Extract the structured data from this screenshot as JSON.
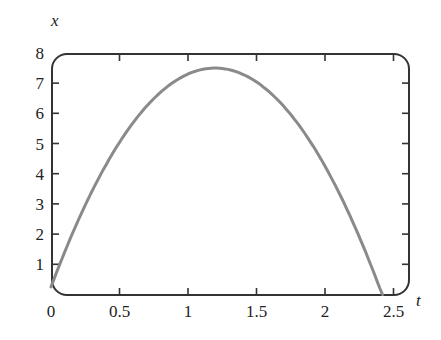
{
  "chart_data": {
    "type": "line",
    "title": "",
    "xlabel": "t",
    "ylabel": "x",
    "xlim": [
      0,
      2.6
    ],
    "ylim": [
      0,
      8
    ],
    "x_ticks": [
      0,
      0.5,
      1,
      1.5,
      2,
      2.5
    ],
    "x_tick_labels": [
      "0",
      "0.5",
      "1",
      "1.5",
      "2",
      "2.5"
    ],
    "y_ticks": [
      1,
      2,
      3,
      4,
      5,
      6,
      7,
      8
    ],
    "y_tick_labels": [
      "1",
      "2",
      "3",
      "4",
      "5",
      "6",
      "7",
      "8"
    ],
    "grid": false,
    "legend": null,
    "frame": "rounded box with ticks on all sides",
    "series": [
      {
        "name": "x(t)",
        "color": "#8a8a8a",
        "x": [
          0,
          0.2,
          0.4,
          0.6,
          0.8,
          1.0,
          1.2,
          1.4,
          1.6,
          1.8,
          2.0,
          2.2,
          2.4,
          2.42
        ],
        "y": [
          0.25,
          2.47,
          4.28,
          5.69,
          6.7,
          7.3,
          7.5,
          7.3,
          6.7,
          5.69,
          4.25,
          2.47,
          0.24,
          0.0
        ]
      }
    ],
    "annotations": []
  },
  "colors": {
    "curve": "#8a8a8a",
    "frame": "#333333",
    "text": "#222222"
  }
}
